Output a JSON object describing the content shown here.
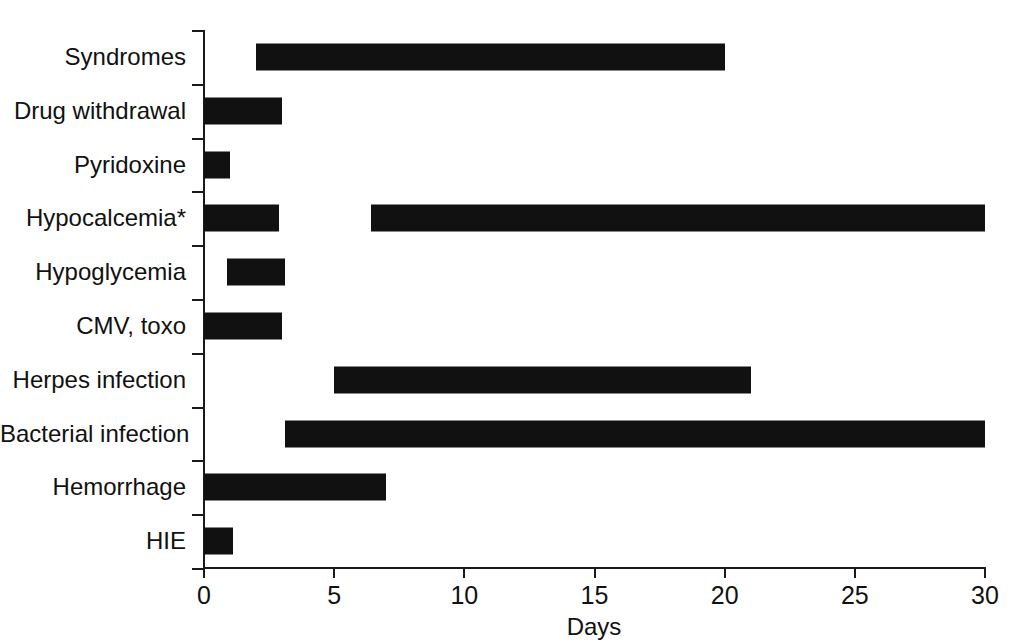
{
  "chart_data": {
    "type": "bar",
    "orientation": "horizontal",
    "subtype": "range-bar",
    "title": "",
    "xlabel": "Days",
    "ylabel": "",
    "xlim": [
      0,
      30
    ],
    "xticks": [
      0,
      5,
      10,
      15,
      20,
      25,
      30
    ],
    "xtick_labels": [
      "0",
      "5",
      "10",
      "15",
      "20",
      "25",
      "30"
    ],
    "grid": false,
    "legend": null,
    "bar_color": "#111111",
    "axis_color": "#1a1a1a",
    "background": "#ffffff",
    "categories": [
      "Syndromes",
      "Drug withdrawal",
      "Pyridoxine",
      "Hypocalcemia*",
      "Hypoglycemia",
      "CMV, toxo",
      "Herpes infection",
      "Bacterial infection",
      "Hemorrhage",
      "HIE"
    ],
    "series": [
      {
        "name": "Onset window (days)",
        "ranges": [
          {
            "category": "Syndromes",
            "segments": [
              [
                2.0,
                20.0
              ]
            ]
          },
          {
            "category": "Drug withdrawal",
            "segments": [
              [
                0.0,
                3.0
              ]
            ]
          },
          {
            "category": "Pyridoxine",
            "segments": [
              [
                0.0,
                1.0
              ]
            ]
          },
          {
            "category": "Hypocalcemia*",
            "segments": [
              [
                0.0,
                2.9
              ],
              [
                6.4,
                30.0
              ]
            ]
          },
          {
            "category": "Hypoglycemia",
            "segments": [
              [
                0.9,
                3.1
              ]
            ]
          },
          {
            "category": "CMV, toxo",
            "segments": [
              [
                0.0,
                3.0
              ]
            ]
          },
          {
            "category": "Herpes infection",
            "segments": [
              [
                5.0,
                21.0
              ]
            ]
          },
          {
            "category": "Bacterial infection",
            "segments": [
              [
                3.1,
                30.0
              ]
            ]
          },
          {
            "category": "Hemorrhage",
            "segments": [
              [
                0.0,
                7.0
              ]
            ]
          },
          {
            "category": "HIE",
            "segments": [
              [
                0.0,
                1.1
              ]
            ]
          }
        ]
      }
    ]
  }
}
